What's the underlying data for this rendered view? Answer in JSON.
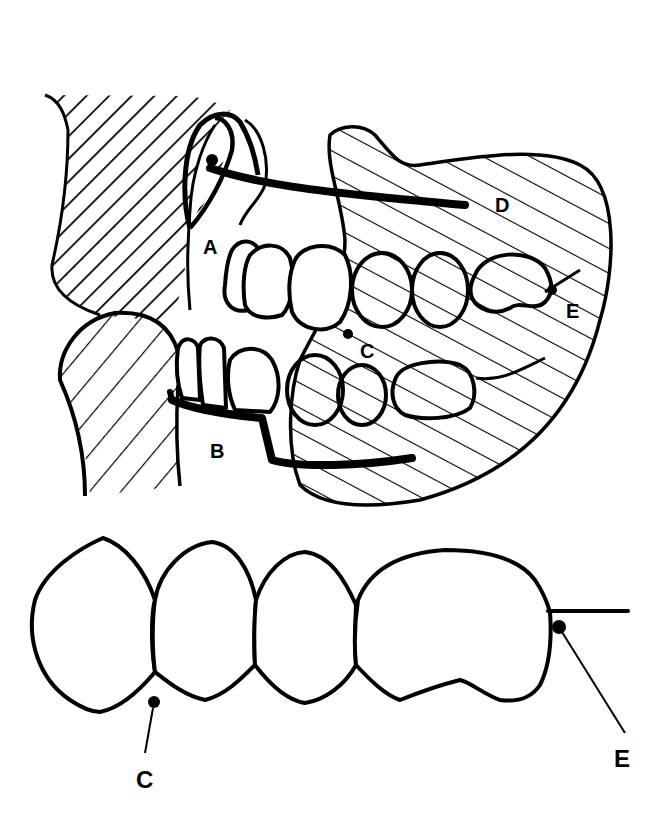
{
  "figure": {
    "title": "",
    "type": "dental anatomy line illustration",
    "colors": {
      "ink": "#000000",
      "background": "#ffffff"
    }
  },
  "upper_view": {
    "labels": {
      "A": "A",
      "B": "B",
      "C": "C",
      "D": "D",
      "E": "E"
    }
  },
  "lower_view": {
    "labels": {
      "C": "C",
      "E": "E"
    }
  }
}
